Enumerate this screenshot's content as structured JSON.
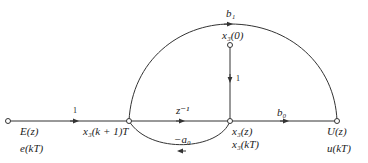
{
  "diagram": {
    "type": "signal-flow-graph",
    "nodes": {
      "input": {
        "label1": "E(z)",
        "label2": "e(kT)"
      },
      "state_next": {
        "label": "x₃(k + 1)T"
      },
      "state": {
        "label1": "x₃(z)",
        "label2": "x₃(kT)"
      },
      "initial": {
        "label": "x₃(0)"
      },
      "output": {
        "label1": "U(z)",
        "label2": "u(kT)"
      }
    },
    "branches": {
      "input_gain": "1",
      "delay": "z⁻¹",
      "feedback": "−a₀",
      "feedforward": "b₁",
      "initial_gain": "1",
      "output_gain": "b₀"
    },
    "colors": {
      "line": "#333333",
      "text": "#222222"
    }
  }
}
